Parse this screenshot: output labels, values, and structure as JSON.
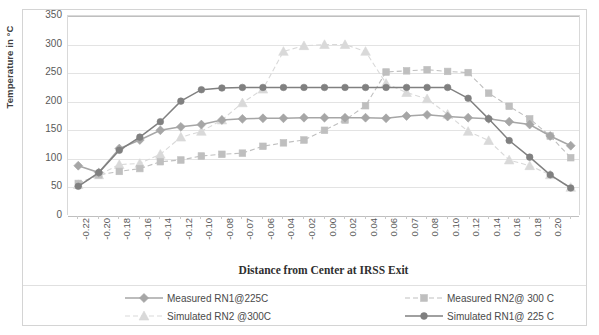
{
  "chart_data": {
    "type": "line",
    "title": "",
    "xlabel": "Distance from Center at IRSS Exit",
    "ylabel": "Temperature in °C",
    "ylim": [
      0,
      350
    ],
    "yticks": [
      0,
      50,
      100,
      150,
      200,
      250,
      300,
      350
    ],
    "grid": true,
    "legend_position": "bottom",
    "categories": [
      "-0.22",
      "-0.20",
      "-0.18",
      "-0.16",
      "-0.14",
      "-0.12",
      "-0.10",
      "-0.08",
      "-0.07",
      "-0.06",
      "-0.04",
      "-0.02",
      "0.00",
      "0.02",
      "0.04",
      "0.06",
      "0.07",
      "0.08",
      "0.10",
      "0.12",
      "0.14",
      "0.16",
      "0.18",
      "0.20",
      ""
    ],
    "series": [
      {
        "name": "Measured RN1@225C",
        "marker": "diamond",
        "color": "#a6a6a6",
        "linestyle": "solid",
        "values": [
          88,
          76,
          118,
          133,
          150,
          156,
          160,
          168,
          170,
          171,
          171,
          172,
          172,
          172,
          172,
          171,
          175,
          177,
          174,
          172,
          170,
          165,
          160,
          140,
          123
        ]
      },
      {
        "name": "Measured RN2@ 300 C",
        "marker": "square",
        "color": "#bfbfbf",
        "linestyle": "dashed",
        "values": [
          57,
          72,
          78,
          83,
          95,
          98,
          105,
          108,
          110,
          122,
          128,
          133,
          150,
          168,
          193,
          252,
          254,
          256,
          253,
          251,
          215,
          192,
          170,
          140,
          102
        ]
      },
      {
        "name": "Simulated RN2 @300C",
        "marker": "triangle",
        "color": "#d9d9d9",
        "linestyle": "dashed",
        "values": [
          55,
          72,
          90,
          92,
          108,
          138,
          148,
          168,
          198,
          222,
          288,
          298,
          300,
          300,
          288,
          232,
          216,
          205,
          178,
          148,
          132,
          98,
          88,
          72,
          50
        ]
      },
      {
        "name": "Simulated RN1@ 225 C",
        "marker": "circle",
        "color": "#808080",
        "linestyle": "solid",
        "values": [
          52,
          76,
          115,
          138,
          165,
          201,
          221,
          224,
          225,
          225,
          225,
          225,
          225,
          225,
          225,
          225,
          225,
          225,
          225,
          206,
          170,
          132,
          103,
          72,
          49
        ]
      }
    ]
  },
  "legend": {
    "items": [
      {
        "label": "Measured RN1@225C",
        "marker": "diamond",
        "color": "#a6a6a6",
        "linestyle": "solid"
      },
      {
        "label": "Measured RN2@ 300 C",
        "marker": "square",
        "color": "#bfbfbf",
        "linestyle": "dashed"
      },
      {
        "label": "Simulated RN2 @300C",
        "marker": "triangle",
        "color": "#d9d9d9",
        "linestyle": "dashed"
      },
      {
        "label": "Simulated RN1@ 225 C",
        "marker": "circle",
        "color": "#808080",
        "linestyle": "solid"
      }
    ]
  }
}
